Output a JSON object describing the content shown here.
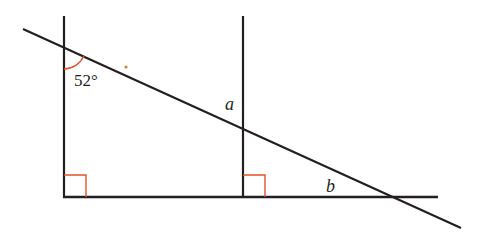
{
  "diagram": {
    "type": "geometry",
    "colors": {
      "line": "#231f20",
      "angle_mark": "#e2502b",
      "background": "#ffffff"
    },
    "labels": {
      "given_angle": "52°",
      "angle_a": "a",
      "angle_b": "b"
    },
    "right_angles": 2
  }
}
